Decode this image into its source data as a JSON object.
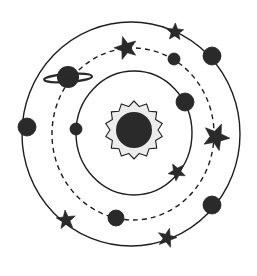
{
  "diagram": {
    "colors": {
      "background": "#ffffff",
      "ink": "#2a2a2a",
      "line": "#1e1e1e",
      "sun_glow": "#ececec"
    },
    "sun": {
      "cx": 134,
      "cy": 130,
      "core_r": 18,
      "rays": 14,
      "ray_outer": 29,
      "ray_inner": 24
    },
    "orbits": [
      {
        "name": "inner-orbit",
        "cx": 134,
        "cy": 133,
        "rx": 58,
        "ry": 62,
        "style": "solid"
      },
      {
        "name": "middle-orbit",
        "cx": 133,
        "cy": 134,
        "rx": 81,
        "ry": 86,
        "style": "dashed"
      },
      {
        "name": "outer-orbit",
        "cx": 131,
        "cy": 134,
        "rx": 109,
        "ry": 112,
        "style": "solid"
      }
    ],
    "planets": [
      {
        "name": "planet-inner-left",
        "cx": 76,
        "cy": 129,
        "r": 6
      },
      {
        "name": "planet-inner-right",
        "cx": 185,
        "cy": 102,
        "r": 9
      },
      {
        "name": "planet-middle-top",
        "cx": 174,
        "cy": 59,
        "r": 6
      },
      {
        "name": "planet-middle-bottom",
        "cx": 116,
        "cy": 218,
        "r": 8
      },
      {
        "name": "planet-outer-left",
        "cx": 27,
        "cy": 127,
        "r": 9
      },
      {
        "name": "planet-outer-top-right",
        "cx": 212,
        "cy": 56,
        "r": 9
      },
      {
        "name": "planet-outer-bottom-right",
        "cx": 212,
        "cy": 205,
        "r": 9
      }
    ],
    "ringed_planet": {
      "name": "ringed-planet",
      "cx": 68,
      "cy": 77,
      "r": 11,
      "ring_rx": 24,
      "ring_ry": 4
    },
    "stars": [
      {
        "name": "star-middle-top",
        "cx": 126,
        "cy": 48,
        "outer": 12,
        "inner": 5
      },
      {
        "name": "star-outer-top",
        "cx": 175,
        "cy": 32,
        "outer": 9,
        "inner": 4
      },
      {
        "name": "star-middle-right",
        "cx": 216,
        "cy": 137,
        "outer": 14,
        "inner": 6
      },
      {
        "name": "star-inner-bottom-right",
        "cx": 177,
        "cy": 172,
        "outer": 9,
        "inner": 4
      },
      {
        "name": "star-outer-bottom-left",
        "cx": 66,
        "cy": 220,
        "outer": 10,
        "inner": 4
      },
      {
        "name": "star-outer-bottom",
        "cx": 167,
        "cy": 238,
        "outer": 10,
        "inner": 4
      }
    ]
  }
}
